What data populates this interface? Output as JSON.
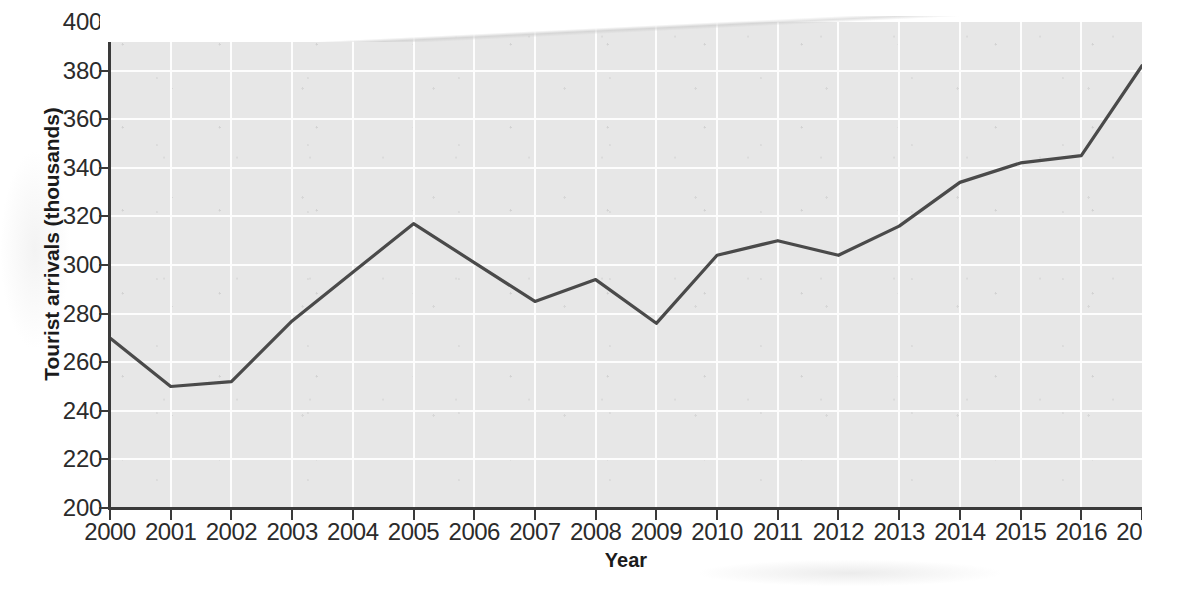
{
  "chart_data": {
    "type": "line",
    "title": "",
    "xlabel": "Year",
    "ylabel": "Tourist arrivals (thousands)",
    "categories": [
      "2000",
      "2001",
      "2002",
      "2003",
      "2004",
      "2005",
      "2006",
      "2007",
      "2008",
      "2009",
      "2010",
      "2011",
      "2012",
      "2013",
      "2014",
      "2015",
      "2016",
      "2017"
    ],
    "x": [
      2000,
      2001,
      2002,
      2003,
      2004,
      2005,
      2006,
      2007,
      2008,
      2009,
      2010,
      2011,
      2012,
      2013,
      2014,
      2015,
      2016,
      2017
    ],
    "values": [
      270,
      250,
      252,
      277,
      297,
      317,
      301,
      285,
      294,
      276,
      304,
      310,
      304,
      316,
      334,
      342,
      345,
      382
    ],
    "series": [
      {
        "name": "Tourist arrivals",
        "values": [
          270,
          250,
          252,
          277,
          297,
          317,
          301,
          285,
          294,
          276,
          304,
          310,
          304,
          316,
          334,
          342,
          345,
          382
        ]
      }
    ],
    "xlim": [
      2000,
      2017
    ],
    "ylim": [
      200,
      400
    ],
    "yticks": [
      200,
      220,
      240,
      260,
      280,
      300,
      320,
      340,
      360,
      380,
      400
    ],
    "xticks": [
      2000,
      2001,
      2002,
      2003,
      2004,
      2005,
      2006,
      2007,
      2008,
      2009,
      2010,
      2011,
      2012,
      2013,
      2014,
      2015,
      2016,
      2017
    ],
    "grid": true,
    "legend": false,
    "legend_position": "none",
    "line_color": "#4a4a4a",
    "plot_background_color": "#e7e7e7",
    "gridline_color": "#fdfdfd",
    "axis_color": "#3a3a3a",
    "text_color": "#2b2b2b"
  }
}
